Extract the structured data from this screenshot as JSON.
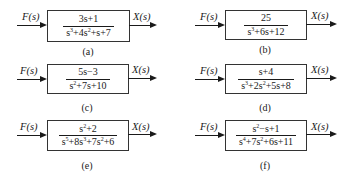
{
  "diagrams": [
    {
      "id": "a",
      "caption": "(a)",
      "input": "F(s)",
      "output": "X(s)",
      "numerator": "3s+1",
      "denominator": [
        {
          "t": "s"
        },
        {
          "sup": "3"
        },
        {
          "t": "+4s"
        },
        {
          "sup": "2"
        },
        {
          "t": "+s+7"
        }
      ]
    },
    {
      "id": "b",
      "caption": "(b)",
      "input": "F(s)",
      "output": "X(s)",
      "numerator": "25",
      "denominator": [
        {
          "t": "s"
        },
        {
          "sup": "3"
        },
        {
          "t": "+6s+12"
        }
      ]
    },
    {
      "id": "c",
      "caption": "(c)",
      "input": "F(s)",
      "output": "X(s)",
      "numerator": "5s−3",
      "denominator": [
        {
          "t": "s"
        },
        {
          "sup": "2"
        },
        {
          "t": "+7s+10"
        }
      ]
    },
    {
      "id": "d",
      "caption": "(d)",
      "input": "F(s)",
      "output": "X(s)",
      "numerator": "s+4",
      "denominator": [
        {
          "t": "s"
        },
        {
          "sup": "3"
        },
        {
          "t": "+2s"
        },
        {
          "sup": "2"
        },
        {
          "t": "+5s+8"
        }
      ]
    },
    {
      "id": "e",
      "caption": "(e)",
      "input": "F(s)",
      "output": "X(s)",
      "numerator_parts": [
        {
          "t": "s"
        },
        {
          "sup": "2"
        },
        {
          "t": "+2"
        }
      ],
      "denominator": [
        {
          "t": "s"
        },
        {
          "sup": "5"
        },
        {
          "t": "+8s"
        },
        {
          "sup": "3"
        },
        {
          "t": "+7s"
        },
        {
          "sup": "2"
        },
        {
          "t": "+6"
        }
      ]
    },
    {
      "id": "f",
      "caption": "(f)",
      "input": "F(s)",
      "output": "X(s)",
      "numerator_parts": [
        {
          "t": "s"
        },
        {
          "sup": "2"
        },
        {
          "t": "−s+1"
        }
      ],
      "denominator": [
        {
          "t": "s"
        },
        {
          "sup": "4"
        },
        {
          "t": "+7s"
        },
        {
          "sup": "2"
        },
        {
          "t": "+6s+11"
        }
      ]
    }
  ]
}
